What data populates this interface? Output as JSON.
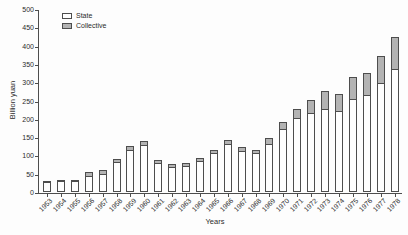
{
  "figure": {
    "kind": "scanned-book-figure",
    "background_color": "#fdfdfd",
    "axis_color": "#4d4d4d",
    "text_color": "#2b2b2b"
  },
  "legend": {
    "items": [
      {
        "label": "State",
        "swatch_color": "#fefefe"
      },
      {
        "label": "Collective",
        "swatch_color": "#b3b3b3"
      }
    ]
  },
  "chart_data": {
    "type": "bar",
    "stacked": true,
    "title": "",
    "xlabel": "Years",
    "ylabel": "Billion yuan",
    "ylim": [
      0,
      500
    ],
    "y_ticks": [
      0,
      50,
      100,
      150,
      200,
      250,
      300,
      350,
      400,
      450,
      500
    ],
    "grid": false,
    "legend_position": "top-left",
    "categories": [
      "1953",
      "1954",
      "1955",
      "1956",
      "1957",
      "1958",
      "1959",
      "1960",
      "1961",
      "1962",
      "1963",
      "1964",
      "1965",
      "1966",
      "1967",
      "1968",
      "1969",
      "1970",
      "1971",
      "1972",
      "1973",
      "1974",
      "1975",
      "1976",
      "1977",
      "1978"
    ],
    "series": [
      {
        "name": "State",
        "color": "#fefefe",
        "values": [
          26,
          29,
          29,
          45,
          49,
          83,
          116,
          128,
          79,
          67,
          71,
          84,
          106,
          131,
          111,
          106,
          132,
          173,
          202,
          215,
          228,
          220,
          255,
          266,
          297,
          336
        ]
      },
      {
        "name": "Collective",
        "color": "#b3b3b3",
        "values": [
          4,
          5,
          5,
          13,
          14,
          12,
          13,
          13,
          12,
          10,
          11,
          11,
          12,
          14,
          13,
          12,
          18,
          23,
          28,
          38,
          52,
          50,
          62,
          64,
          77,
          90
        ]
      }
    ],
    "bar_border_color": "#4d4d4d"
  }
}
